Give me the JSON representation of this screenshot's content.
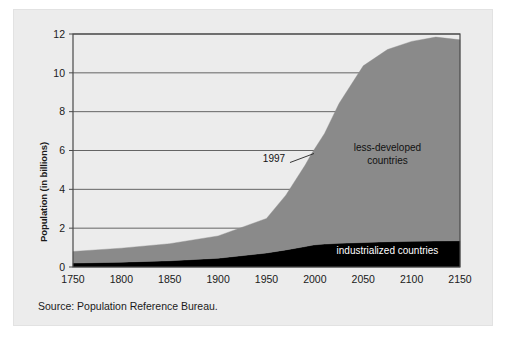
{
  "figure": {
    "background_color": "#ececec",
    "plot_background_color": "#ffffff",
    "source_note": "Source: Population Reference Bureau."
  },
  "chart_data": {
    "type": "area",
    "stacked": true,
    "title": "",
    "subtitle": "",
    "xlabel": "",
    "ylabel": "Population (in billions)",
    "xlim": [
      1750,
      2150
    ],
    "ylim": [
      0,
      12
    ],
    "grid": true,
    "grid_axis": "y",
    "legend_position": "inside-annotations",
    "xticks": [
      1750,
      1800,
      1850,
      1900,
      1950,
      2000,
      2050,
      2100,
      2150
    ],
    "xtick_labels": [
      "1750",
      "1800",
      "1850",
      "1900",
      "1950",
      "2000",
      "2050",
      "2100",
      "2150"
    ],
    "yticks": [
      0,
      2,
      4,
      6,
      8,
      10,
      12
    ],
    "ytick_labels": [
      "0",
      "2",
      "4",
      "6",
      "8",
      "10",
      "12"
    ],
    "x": [
      1750,
      1800,
      1850,
      1900,
      1950,
      1970,
      1990,
      1997,
      2000,
      2010,
      2025,
      2050,
      2075,
      2100,
      2125,
      2150
    ],
    "series": [
      {
        "name": "industrialized countries",
        "color": "#000000",
        "label_color": "#ffffff",
        "values": [
          0.2,
          0.25,
          0.32,
          0.45,
          0.72,
          0.88,
          1.05,
          1.12,
          1.14,
          1.18,
          1.22,
          1.26,
          1.3,
          1.32,
          1.34,
          1.35
        ]
      },
      {
        "name": "less-developed countries",
        "color": "#8a8a8a",
        "label_color": "#111111",
        "values": [
          0.6,
          0.72,
          0.88,
          1.15,
          1.78,
          2.82,
          4.2,
          4.75,
          4.96,
          5.7,
          7.2,
          9.1,
          9.9,
          10.3,
          10.5,
          10.35
        ]
      }
    ],
    "totals": [
      0.8,
      0.97,
      1.2,
      1.6,
      2.5,
      3.7,
      5.25,
      5.87,
      6.1,
      6.88,
      8.42,
      10.36,
      11.2,
      11.62,
      11.84,
      11.7
    ],
    "annotations": [
      {
        "name": "year-callout",
        "text": "1997",
        "x": 1997,
        "y": 5.87,
        "has_leader_line": true
      },
      {
        "name": "less-developed-label",
        "text_line1": "less-developed",
        "text_line2": "countries",
        "x": 2075,
        "y": 6.0
      },
      {
        "name": "industrialized-label",
        "text": "industrialized countries",
        "x": 2075,
        "y": 0.65
      }
    ]
  }
}
